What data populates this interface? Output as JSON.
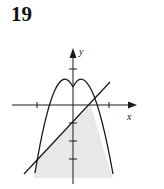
{
  "problem_number": "19",
  "diagram": {
    "axes": {
      "x_label": "x",
      "y_label": "y"
    },
    "curves": [
      {
        "name": "parabola",
        "equation": "y = 1 - x^2"
      },
      {
        "name": "line",
        "equation": "y = x - 1"
      }
    ],
    "shaded_region": "y <= 1 - x^2 and y <= x - 1",
    "intersections": [
      [
        1,
        0
      ],
      [
        -2,
        -3
      ]
    ],
    "colors": {
      "stroke": "#1a1a1a",
      "shade": "#e8e8e8"
    }
  }
}
